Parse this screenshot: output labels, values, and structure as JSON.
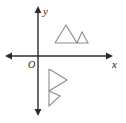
{
  "figure": {
    "type": "coordinate-plane-with-shapes",
    "title": "",
    "background_color": "#ffffff"
  },
  "axes": {
    "origin_label": "O",
    "x_axis": {
      "label": "x",
      "color": "#2b2b2b",
      "y_pixel": 56,
      "x_start": 6,
      "x_end": 112,
      "arrow_start": true,
      "arrow_end": true
    },
    "y_axis": {
      "label": "y",
      "color": "#2b2b2b",
      "x_pixel": 38,
      "y_start": 7,
      "y_end": 115,
      "arrow_start": true,
      "arrow_end": true
    }
  },
  "shapes": [
    {
      "name": "upper-double-triangle",
      "description": "two adjacent upward-pointing triangles in quadrant I",
      "quadrant": "I",
      "stroke_color": "#8c8c8c",
      "stroke_width": 1.1,
      "fill": "none",
      "points": "55,43 66,25 77,43 82,32 88,43 55,43"
    },
    {
      "name": "lower-double-triangle",
      "description": "same figure rotated 90 degrees clockwise, pointing right, in quadrant IV",
      "quadrant": "IV",
      "stroke_color": "#8c8c8c",
      "stroke_width": 1.1,
      "fill": "none",
      "points": "49,69 67,80 49,91 60,96 49,106 49,69"
    }
  ],
  "labels": {
    "x": "x",
    "y": "y",
    "origin": "O"
  }
}
